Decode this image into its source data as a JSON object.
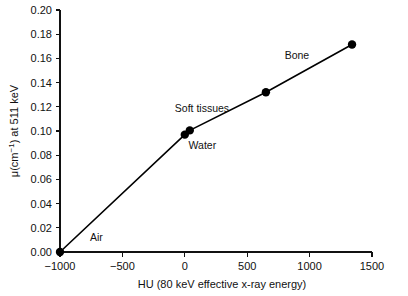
{
  "chart_data": {
    "type": "line",
    "title": "",
    "subtitle": "",
    "xlabel": "HU (80 keV effective x-ray energy)",
    "ylabel": "μ(cm⁻¹) at 511 keV",
    "ylabel_parts": {
      "prefix": "μ(cm",
      "superscript": "−1",
      "suffix": ") at 511 keV"
    },
    "xlim": [
      -1100,
      1560
    ],
    "ylim": [
      0.0,
      0.2
    ],
    "xticks": [
      -1000,
      -500,
      0,
      500,
      1000,
      1500
    ],
    "xtick_labels": [
      "−1000",
      "−500",
      "0",
      "500",
      "1000",
      "1500"
    ],
    "yticks": [
      0.0,
      0.02,
      0.04,
      0.06,
      0.08,
      0.1,
      0.12,
      0.14,
      0.16,
      0.18,
      0.2
    ],
    "ytick_labels": [
      "0.00",
      "0.02",
      "0.04",
      "0.06",
      "0.08",
      "0.10",
      "0.12",
      "0.14",
      "0.16",
      "0.18",
      "0.20"
    ],
    "grid": false,
    "legend": false,
    "series": [
      {
        "name": "μ at 511 keV vs HU",
        "x": [
          -1000,
          0,
          40,
          650,
          1340
        ],
        "y": [
          0.0,
          0.097,
          0.1005,
          0.132,
          0.1715
        ],
        "marker": "filled-circle",
        "line_color": "#000000",
        "marker_color": "#000000"
      }
    ],
    "annotations": [
      {
        "text": "Air",
        "x": -760,
        "y": 0.009,
        "anchor": "start"
      },
      {
        "text": "Soft tissues",
        "x": -80,
        "y": 0.1155,
        "anchor": "start"
      },
      {
        "text": "Water",
        "x": 30,
        "y": 0.0855,
        "anchor": "start"
      },
      {
        "text": "Bone",
        "x": 800,
        "y": 0.1595,
        "anchor": "start"
      }
    ],
    "colors": {
      "axis": "#111111",
      "line": "#000000",
      "marker": "#000000",
      "background": "#ffffff"
    }
  }
}
